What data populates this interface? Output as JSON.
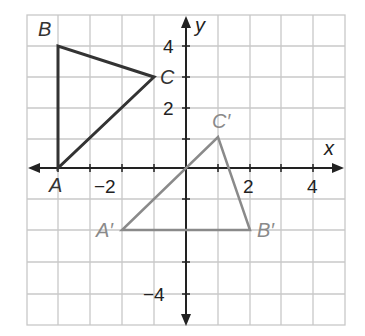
{
  "figure": {
    "axes": {
      "x_label": "x",
      "y_label": "y",
      "x_range": [
        -5,
        5
      ],
      "y_range": [
        -5,
        5
      ],
      "x_tick_labels": [
        "-2",
        "2",
        "4"
      ],
      "y_tick_labels": [
        "4",
        "2",
        "-4"
      ]
    },
    "triangles": [
      {
        "name": "ABC",
        "color": "#333333",
        "vertices": [
          {
            "label": "A",
            "x": -4,
            "y": 0
          },
          {
            "label": "B",
            "x": -4,
            "y": 4
          },
          {
            "label": "C",
            "x": -1,
            "y": 3
          }
        ]
      },
      {
        "name": "A'B'C'",
        "color": "#8a8a8a",
        "vertices": [
          {
            "label": "A′",
            "x": -2,
            "y": -2
          },
          {
            "label": "B′",
            "x": 2,
            "y": -2
          },
          {
            "label": "C′",
            "x": 1,
            "y": 1
          }
        ]
      }
    ],
    "colors": {
      "grid": "#c8c8c8",
      "axis": "#222222",
      "original_triangle": "#333333",
      "image_triangle": "#8a8a8a"
    }
  }
}
